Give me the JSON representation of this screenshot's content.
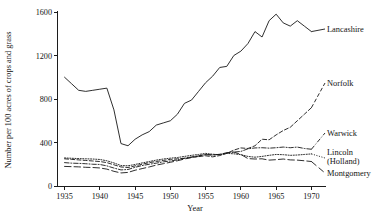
{
  "chart_data": {
    "type": "line",
    "title": "",
    "xlabel": "Year",
    "ylabel": "Number per 100 acres of crops and grass",
    "xlim": [
      1934,
      1971.5
    ],
    "ylim": [
      0,
      1600
    ],
    "grid": false,
    "legend_position": "right-inline-labels",
    "xticks": [
      1935,
      1940,
      1945,
      1950,
      1955,
      1960,
      1965,
      1970
    ],
    "xtick_labels": [
      "1935",
      "1940",
      "1945",
      "1950",
      "1955",
      "1960",
      "1965",
      "1970"
    ],
    "yticks": [
      0,
      400,
      800,
      1200,
      1600
    ],
    "ytick_labels": [
      "0",
      "400",
      "800",
      "1200",
      "1600"
    ],
    "x": [
      1935,
      1936,
      1937,
      1938,
      1939,
      1940,
      1941,
      1942,
      1943,
      1944,
      1945,
      1946,
      1947,
      1948,
      1949,
      1950,
      1951,
      1952,
      1953,
      1954,
      1955,
      1956,
      1957,
      1958,
      1959,
      1960,
      1961,
      1962,
      1963,
      1964,
      1965,
      1966,
      1967,
      1968,
      1969,
      1970
    ],
    "series": [
      {
        "name": "Lancashire",
        "style": "solid",
        "label": "Lancashire",
        "values": [
          1000,
          940,
          880,
          870,
          880,
          890,
          900,
          700,
          390,
          370,
          430,
          470,
          500,
          560,
          580,
          600,
          660,
          760,
          790,
          870,
          950,
          1010,
          1090,
          1100,
          1200,
          1240,
          1310,
          1420,
          1370,
          1520,
          1580,
          1500,
          1470,
          1520,
          1470,
          1420
        ]
      },
      {
        "name": "Norfolk",
        "style": "dashed",
        "label": "Norfolk",
        "values": [
          250,
          245,
          240,
          235,
          230,
          225,
          215,
          195,
          175,
          170,
          185,
          200,
          215,
          225,
          235,
          245,
          250,
          255,
          262,
          270,
          278,
          268,
          280,
          300,
          330,
          350,
          345,
          370,
          430,
          425,
          470,
          510,
          540,
          600,
          660,
          720
        ]
      },
      {
        "name": "Warwick",
        "style": "dashdot",
        "label": "Warwick",
        "values": [
          215,
          210,
          208,
          205,
          200,
          198,
          185,
          165,
          148,
          152,
          172,
          188,
          200,
          210,
          222,
          230,
          240,
          255,
          268,
          278,
          290,
          285,
          290,
          305,
          312,
          318,
          342,
          350,
          352,
          348,
          352,
          358,
          352,
          358,
          345,
          338
        ]
      },
      {
        "name": "Lincoln (Holland)",
        "style": "dotted",
        "label": "Lincoln\n(Holland)",
        "values": [
          258,
          255,
          252,
          250,
          248,
          244,
          232,
          212,
          188,
          186,
          198,
          212,
          225,
          238,
          248,
          256,
          262,
          272,
          282,
          290,
          300,
          292,
          288,
          300,
          296,
          288,
          272,
          265,
          272,
          282,
          290,
          288,
          282,
          285,
          290,
          295
        ]
      },
      {
        "name": "Montgomery",
        "style": "longdash",
        "label": "Montgomery",
        "values": [
          180,
          178,
          176,
          172,
          170,
          166,
          155,
          135,
          120,
          125,
          145,
          160,
          175,
          192,
          205,
          218,
          232,
          248,
          262,
          275,
          288,
          285,
          292,
          305,
          312,
          290,
          252,
          248,
          250,
          238,
          242,
          248,
          240,
          238,
          232,
          225
        ]
      }
    ]
  },
  "labels": {
    "lancashire": "Lancashire",
    "norfolk": "Norfolk",
    "warwick": "Warwick",
    "lincoln_line1": "Lincoln",
    "lincoln_line2": "(Holland)",
    "montgomery": "Montgomery",
    "xaxis_title": "Year",
    "yaxis_title": "Number per 100 acres of crops and grass"
  },
  "colors": {
    "ink": "#171717",
    "background": "#ffffff"
  }
}
